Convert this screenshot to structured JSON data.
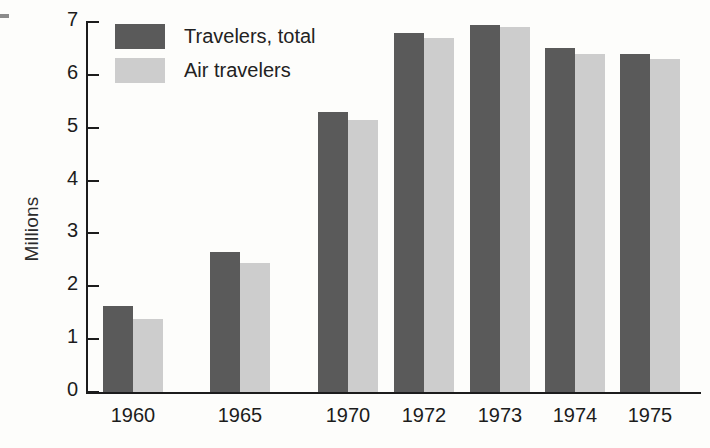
{
  "chart_data": {
    "type": "bar",
    "title": "",
    "xlabel": "",
    "ylabel": "Millions",
    "categories": [
      "1960",
      "1965",
      "1970",
      "1972",
      "1973",
      "1974",
      "1975"
    ],
    "series": [
      {
        "name": "Travelers, total",
        "color": "#5a5a5a",
        "values": [
          1.62,
          2.65,
          5.3,
          6.8,
          6.95,
          6.5,
          6.4
        ]
      },
      {
        "name": "Air travelers",
        "color": "#cdcdcd",
        "values": [
          1.38,
          2.45,
          5.15,
          6.7,
          6.9,
          6.4,
          6.3
        ]
      }
    ],
    "ylim": [
      0,
      7
    ],
    "ytick_labels": [
      "0",
      "1",
      "2",
      "3",
      "4",
      "5",
      "6",
      "7"
    ],
    "ytick_values": [
      0,
      1,
      2,
      3,
      4,
      5,
      6,
      7
    ],
    "grid": false,
    "legend_position": "top-left"
  },
  "legend": {
    "entries": [
      {
        "label": "Travelers, total",
        "color": "#5a5a5a"
      },
      {
        "label": "Air travelers",
        "color": "#cdcdcd"
      }
    ]
  },
  "axes": {
    "y_title": "Millions"
  },
  "layout": {
    "group_centers_px": [
      133,
      240,
      348,
      424,
      500,
      575,
      650
    ],
    "bar_width_px": 30,
    "baseline_y_px": 392,
    "top_y_px": 22,
    "unit_px": 52.86
  }
}
